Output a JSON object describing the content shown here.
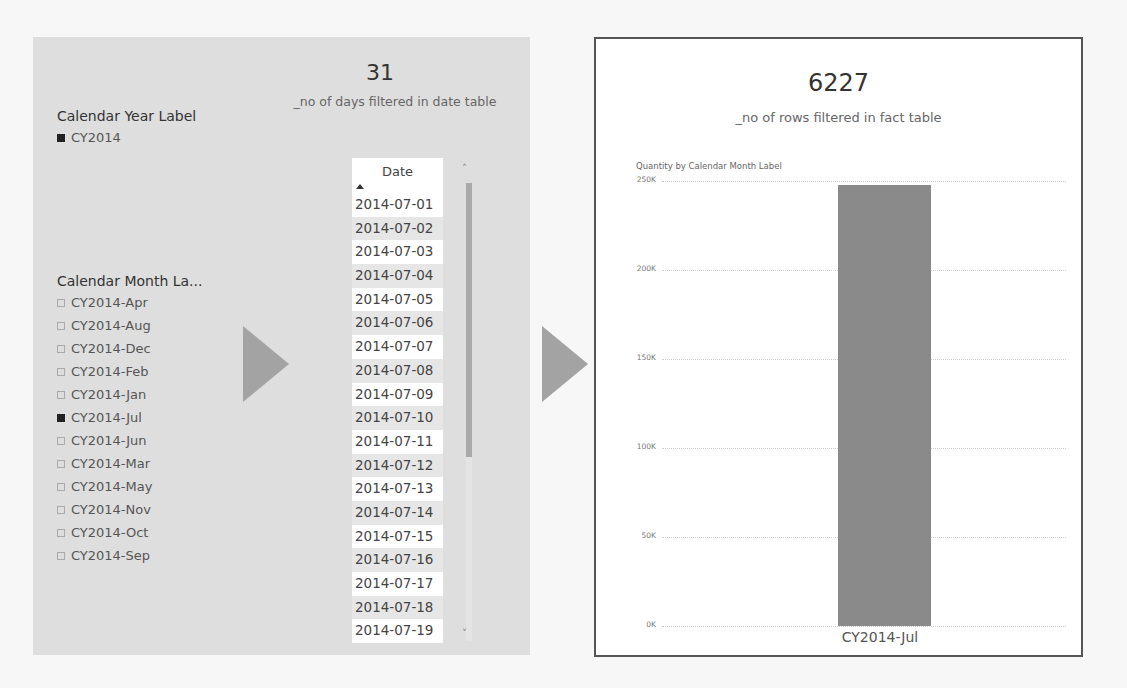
{
  "left_panel": {
    "year_slicer": {
      "title": "Calendar Year Label",
      "items": [
        {
          "label": "CY2014",
          "checked": true
        }
      ]
    },
    "days_card": {
      "value": "31",
      "label": "_no of days filtered in date table"
    },
    "month_slicer": {
      "title": "Calendar Month La...",
      "items": [
        {
          "label": "CY2014-Apr",
          "checked": false
        },
        {
          "label": "CY2014-Aug",
          "checked": false
        },
        {
          "label": "CY2014-Dec",
          "checked": false
        },
        {
          "label": "CY2014-Feb",
          "checked": false
        },
        {
          "label": "CY2014-Jan",
          "checked": false
        },
        {
          "label": "CY2014-Jul",
          "checked": true
        },
        {
          "label": "CY2014-Jun",
          "checked": false
        },
        {
          "label": "CY2014-Mar",
          "checked": false
        },
        {
          "label": "CY2014-May",
          "checked": false
        },
        {
          "label": "CY2014-Nov",
          "checked": false
        },
        {
          "label": "CY2014-Oct",
          "checked": false
        },
        {
          "label": "CY2014-Sep",
          "checked": false
        }
      ]
    },
    "date_table": {
      "header": "Date",
      "sort": "ascending",
      "rows": [
        "2014-07-01",
        "2014-07-02",
        "2014-07-03",
        "2014-07-04",
        "2014-07-05",
        "2014-07-06",
        "2014-07-07",
        "2014-07-08",
        "2014-07-09",
        "2014-07-10",
        "2014-07-11",
        "2014-07-12",
        "2014-07-13",
        "2014-07-14",
        "2014-07-15",
        "2014-07-16",
        "2014-07-17",
        "2014-07-18",
        "2014-07-19"
      ],
      "scroll_up_glyph": "˄",
      "scroll_down_glyph": "˅"
    }
  },
  "arrows": [
    "arrow-right-icon",
    "arrow-right-icon"
  ],
  "right_panel": {
    "rows_card": {
      "value": "6227",
      "label": "_no of rows filtered in fact table"
    }
  },
  "colors": {
    "left_panel_bg": "#dedede",
    "bar": "#8a8a8a",
    "arrow": "#a3a3a3",
    "border": "#555555"
  },
  "chart_data": {
    "type": "bar",
    "title": "Quantity by Calendar Month Label",
    "categories": [
      "CY2014-Jul"
    ],
    "values": [
      248000
    ],
    "xlabel": "",
    "ylabel": "",
    "ylim": [
      0,
      250000
    ],
    "yticks": [
      "0K",
      "50K",
      "100K",
      "150K",
      "200K",
      "250K"
    ],
    "grid": true,
    "legend": "none"
  }
}
